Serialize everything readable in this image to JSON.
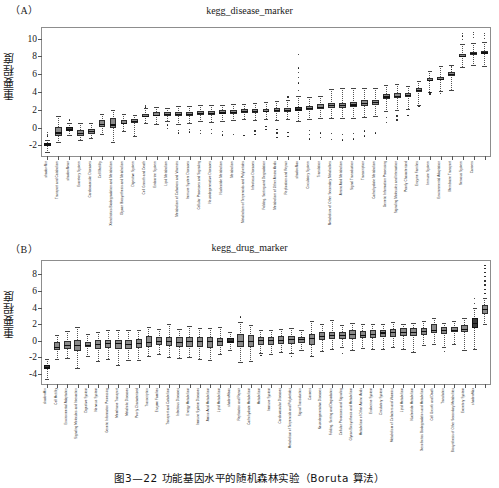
{
  "figure": {
    "caption": "图3—22  功能基因水平的随机森林实验（Boruta 算法）"
  },
  "panels": [
    {
      "tag": "（A）",
      "title": "kegg_disease_marker",
      "ylabel": "重要程度"
    },
    {
      "tag": "（B）",
      "title": "kegg_drug_marker",
      "ylabel": "重要程度"
    }
  ],
  "chart_data": [
    {
      "type": "box",
      "title": "kegg_disease_marker",
      "xlabel": "",
      "ylabel": "重要程度",
      "ylim": [
        -3.2,
        11.2
      ],
      "yticks": [
        -2,
        0,
        2,
        4,
        6,
        8,
        10
      ],
      "grid": false,
      "legend": "none",
      "categories": [
        "shadowMin",
        "Transport and Catabolism",
        "shadowMean",
        "Excretory System",
        "Cardiovascular Diseases",
        "Cell Motility",
        "Xenobiotics Biodegradation and Metabolism",
        "Glycan Biosynthesis and Metabolism",
        "Digestive System",
        "Cell Growth and Death",
        "Endocrine System",
        "Lipid Metabolism",
        "Metabolism of Cofactors and Vitamins",
        "Immune System Diseases",
        "Cellular Processes and Signaling",
        "Neurodegenerative Diseases",
        "Nucleotide Metabolism",
        "Metabolism",
        "Metabolism of Terpenoids and Polyketides",
        "Infectious Diseases",
        "Folding, Sorting and Degradation",
        "Metabolism of Other Amino Acids",
        "Replication and Repair",
        "shadowMax",
        "Circulatory System",
        "Translation",
        "Metabolism of Other Secondary Metabolites",
        "Amino Acid Metabolism",
        "Signal Transduction",
        "Transcription",
        "Carbohydrate Metabolism",
        "Genetic Information Processing",
        "Signaling Molecules and Interaction",
        "Poorly Characterized",
        "Enzyme Families",
        "Immune System",
        "Environmental Adaptation",
        "Membrane Transport",
        "Nervous System",
        "Cancers"
      ],
      "boxes": [
        {
          "q1": -2.05,
          "median": -1.8,
          "q3": -1.7,
          "low": -2.75,
          "high": -1.35,
          "outliers": [
            -0.95,
            -0.75,
            -0.55
          ]
        },
        {
          "q1": -0.95,
          "median": -0.55,
          "q3": 0.05,
          "low": -1.6,
          "high": 1.3,
          "outliers": []
        },
        {
          "q1": -0.35,
          "median": -0.15,
          "q3": 0.1,
          "low": -0.8,
          "high": 0.55,
          "outliers": [
            0.8,
            0.85
          ]
        },
        {
          "q1": -0.95,
          "median": -0.6,
          "q3": -0.3,
          "low": -1.35,
          "high": 0.55,
          "outliers": []
        },
        {
          "q1": -0.7,
          "median": -0.4,
          "q3": -0.2,
          "low": -1.15,
          "high": 0.5,
          "outliers": []
        },
        {
          "q1": 0.05,
          "median": 0.4,
          "q3": 0.85,
          "low": -0.75,
          "high": 1.55,
          "outliers": []
        },
        {
          "q1": -0.05,
          "median": 0.35,
          "q3": 1.05,
          "low": -1.6,
          "high": 1.95,
          "outliers": []
        },
        {
          "q1": 0.35,
          "median": 0.55,
          "q3": 0.8,
          "low": -0.4,
          "high": 1.55,
          "outliers": []
        },
        {
          "q1": 0.5,
          "median": 0.7,
          "q3": 0.95,
          "low": -0.9,
          "high": 1.45,
          "outliers": []
        },
        {
          "q1": 1.15,
          "median": 1.35,
          "q3": 1.55,
          "low": 0.55,
          "high": 2.25,
          "outliers": [
            2.3,
            2.45
          ]
        },
        {
          "q1": 1.25,
          "median": 1.45,
          "q3": 1.7,
          "low": 0.4,
          "high": 2.35,
          "outliers": []
        },
        {
          "q1": 1.35,
          "median": 1.55,
          "q3": 1.75,
          "low": 0.75,
          "high": 2.25,
          "outliers": [
            -0.1,
            0.3
          ]
        },
        {
          "q1": 1.3,
          "median": 1.5,
          "q3": 1.75,
          "low": 0.45,
          "high": 2.45,
          "outliers": [
            -0.6,
            -0.3
          ]
        },
        {
          "q1": 1.35,
          "median": 1.55,
          "q3": 1.8,
          "low": 0.55,
          "high": 2.45,
          "outliers": [
            -0.5,
            -0.2
          ]
        },
        {
          "q1": 1.45,
          "median": 1.65,
          "q3": 1.9,
          "low": 0.7,
          "high": 2.55,
          "outliers": [
            -0.7,
            -0.35
          ]
        },
        {
          "q1": 1.45,
          "median": 1.65,
          "q3": 1.85,
          "low": 0.6,
          "high": 2.5,
          "outliers": [
            -0.65,
            -0.25
          ]
        },
        {
          "q1": 1.5,
          "median": 1.7,
          "q3": 1.95,
          "low": 0.75,
          "high": 2.55,
          "outliers": [
            -0.85,
            -0.45
          ]
        },
        {
          "q1": 1.55,
          "median": 1.75,
          "q3": 1.95,
          "low": 0.85,
          "high": 2.6,
          "outliers": [
            -0.75
          ]
        },
        {
          "q1": 1.65,
          "median": 1.85,
          "q3": 2.05,
          "low": 0.95,
          "high": 2.7,
          "outliers": [
            -0.9
          ]
        },
        {
          "q1": 1.65,
          "median": 1.85,
          "q3": 2.05,
          "low": 0.85,
          "high": 2.75,
          "outliers": [
            -0.8,
            -0.4
          ]
        },
        {
          "q1": 1.7,
          "median": 1.9,
          "q3": 2.1,
          "low": 0.95,
          "high": 2.85,
          "outliers": [
            -0.2,
            0.1
          ]
        },
        {
          "q1": 1.75,
          "median": 1.95,
          "q3": 2.15,
          "low": 0.9,
          "high": 2.95,
          "outliers": [
            -1.1,
            -0.6,
            -0.2
          ]
        },
        {
          "q1": 1.8,
          "median": 2.0,
          "q3": 2.2,
          "low": 0.95,
          "high": 3.05,
          "outliers": [
            -1.0,
            -0.55,
            3.45
          ]
        },
        {
          "q1": 1.85,
          "median": 2.05,
          "q3": 2.3,
          "low": 0.75,
          "high": 3.55,
          "outliers": [
            4.2,
            5.0,
            5.6,
            6.2,
            6.7,
            8.25
          ]
        },
        {
          "q1": 1.95,
          "median": 2.2,
          "q3": 2.45,
          "low": 1.0,
          "high": 3.45,
          "outliers": [
            -1.3,
            -0.8,
            -0.3
          ]
        },
        {
          "q1": 2.1,
          "median": 2.35,
          "q3": 2.6,
          "low": 1.1,
          "high": 3.6,
          "outliers": [
            -1.1,
            -0.6
          ]
        },
        {
          "q1": 2.25,
          "median": 2.5,
          "q3": 2.75,
          "low": 1.05,
          "high": 4.35,
          "outliers": [
            -1.35,
            -0.7
          ]
        },
        {
          "q1": 2.25,
          "median": 2.5,
          "q3": 2.8,
          "low": 1.05,
          "high": 4.4,
          "outliers": [
            -1.4,
            -0.75
          ]
        },
        {
          "q1": 2.3,
          "median": 2.6,
          "q3": 2.9,
          "low": 1.1,
          "high": 4.5,
          "outliers": [
            -1.3,
            -0.65
          ]
        },
        {
          "q1": 2.45,
          "median": 2.75,
          "q3": 3.05,
          "low": 1.2,
          "high": 4.45,
          "outliers": [
            -0.95,
            -0.4
          ]
        },
        {
          "q1": 2.55,
          "median": 2.85,
          "q3": 3.15,
          "low": 1.25,
          "high": 4.5,
          "outliers": [
            -0.6
          ]
        },
        {
          "q1": 3.25,
          "median": 3.5,
          "q3": 3.75,
          "low": 1.85,
          "high": 4.8,
          "outliers": [
            0.55,
            1.1
          ]
        },
        {
          "q1": 3.35,
          "median": 3.6,
          "q3": 3.85,
          "low": 1.95,
          "high": 4.85,
          "outliers": [
            0.85,
            1.3
          ]
        },
        {
          "q1": 3.45,
          "median": 3.65,
          "q3": 3.9,
          "low": 2.05,
          "high": 4.7,
          "outliers": [
            1.35
          ]
        },
        {
          "q1": 3.95,
          "median": 4.2,
          "q3": 4.45,
          "low": 2.55,
          "high": 5.25,
          "outliers": [
            2.4
          ]
        },
        {
          "q1": 5.2,
          "median": 5.4,
          "q3": 5.6,
          "low": 4.0,
          "high": 6.35,
          "outliers": [
            3.7,
            3.9
          ]
        },
        {
          "q1": 5.3,
          "median": 5.5,
          "q3": 5.7,
          "low": 4.1,
          "high": 6.95,
          "outliers": [
            3.85
          ]
        },
        {
          "q1": 5.8,
          "median": 6.0,
          "q3": 6.2,
          "low": 4.2,
          "high": 7.0,
          "outliers": [
            6.55,
            6.9
          ]
        },
        {
          "q1": 7.95,
          "median": 8.1,
          "q3": 8.3,
          "low": 6.85,
          "high": 9.35,
          "outliers": [
            9.9,
            10.3,
            10.55
          ]
        },
        {
          "q1": 8.2,
          "median": 8.35,
          "q3": 8.55,
          "low": 7.05,
          "high": 9.55,
          "outliers": [
            10.1,
            10.45,
            10.7
          ]
        },
        {
          "q1": 8.3,
          "median": 8.45,
          "q3": 8.65,
          "low": 6.95,
          "high": 9.6,
          "outliers": [
            10.05,
            10.35,
            10.6
          ]
        }
      ]
    },
    {
      "type": "box",
      "title": "kegg_drug_marker",
      "xlabel": "",
      "ylabel": "重要程度",
      "ylim": [
        -5.2,
        9.6
      ],
      "yticks": [
        -4,
        -2,
        0,
        2,
        4,
        6,
        8
      ],
      "grid": false,
      "legend": "none",
      "categories": [
        "shadowMin",
        "Cell Motility",
        "Environmental Adaptation",
        "Signaling Molecules and Interaction",
        "Digestive System",
        "Nervous System",
        "Genetic Information Processing",
        "Membrane Transport",
        "Metabolic Diseases",
        "Poorly Characterized",
        "Transcription",
        "Enzyme Families",
        "Transport and Catabolism",
        "Infectious Diseases",
        "Energy Metabolism",
        "Immune System Diseases",
        "Amino Acid Metabolism",
        "Lipid Metabolism",
        "shadowMean",
        "Replication and Repair",
        "Carbohydrate Metabolism",
        "Metabolism",
        "Immune System",
        "Cardiovascular Diseases",
        "Metabolism of Terpenoids and Polyketides",
        "Signal Transduction",
        "Cancers",
        "Neurodegenerative Diseases",
        "Folding, Sorting and Degradation",
        "Cellular Processes and Signaling",
        "Glycan Biosynthesis and Metabolism",
        "Metabolism of Other Amino Acids",
        "Endocrine System",
        "Circulatory System",
        "Metabolism of Cofactors and Vitamins",
        "Lipid Metabolism",
        "Nucleotide Metabolism",
        "Xenobiotics Biodegradation and Metabolism",
        "Cell Growth and Death",
        "Translation",
        "Biosynthesis of Other Secondary Metabolites",
        "Excretory System",
        "shadowMax"
      ],
      "boxes": [
        {
          "q1": -3.4,
          "median": -3.15,
          "q3": -2.95,
          "low": -4.55,
          "high": -2.15,
          "outliers": []
        },
        {
          "q1": -1.15,
          "median": -0.7,
          "q3": -0.15,
          "low": -2.25,
          "high": 0.65,
          "outliers": []
        },
        {
          "q1": -0.95,
          "median": -0.45,
          "q3": 0.0,
          "low": -2.1,
          "high": 1.2,
          "outliers": []
        },
        {
          "q1": -1.2,
          "median": -0.55,
          "q3": 0.05,
          "low": -3.25,
          "high": 1.6,
          "outliers": []
        },
        {
          "q1": -0.8,
          "median": -0.45,
          "q3": -0.1,
          "low": -1.85,
          "high": 0.8,
          "outliers": []
        },
        {
          "q1": -0.95,
          "median": -0.4,
          "q3": 0.05,
          "low": -2.4,
          "high": 1.1,
          "outliers": []
        },
        {
          "q1": -0.85,
          "median": -0.3,
          "q3": 0.15,
          "low": -2.2,
          "high": 1.25,
          "outliers": []
        },
        {
          "q1": -0.95,
          "median": -0.3,
          "q3": 0.15,
          "low": -2.95,
          "high": 1.35,
          "outliers": []
        },
        {
          "q1": -0.95,
          "median": -0.35,
          "q3": 0.15,
          "low": -2.3,
          "high": 1.3,
          "outliers": []
        },
        {
          "q1": -0.9,
          "median": -0.25,
          "q3": 0.2,
          "low": -2.35,
          "high": 1.25,
          "outliers": []
        },
        {
          "q1": -0.7,
          "median": -0.15,
          "q3": 0.55,
          "low": -1.85,
          "high": 1.65,
          "outliers": []
        },
        {
          "q1": -0.55,
          "median": -0.05,
          "q3": 0.4,
          "low": -1.55,
          "high": 1.4,
          "outliers": []
        },
        {
          "q1": -0.65,
          "median": 0.0,
          "q3": 0.5,
          "low": -1.9,
          "high": 2.0,
          "outliers": []
        },
        {
          "q1": -0.75,
          "median": -0.1,
          "q3": 0.4,
          "low": -2.1,
          "high": 1.45,
          "outliers": []
        },
        {
          "q1": -0.7,
          "median": 0.0,
          "q3": 0.5,
          "low": -1.95,
          "high": 1.8,
          "outliers": []
        },
        {
          "q1": -0.8,
          "median": 0.0,
          "q3": 0.45,
          "low": -2.15,
          "high": 1.55,
          "outliers": []
        },
        {
          "q1": -0.85,
          "median": 0.0,
          "q3": 0.5,
          "low": -2.35,
          "high": 1.5,
          "outliers": []
        },
        {
          "q1": -0.6,
          "median": 0.0,
          "q3": 0.35,
          "low": -1.55,
          "high": 1.6,
          "outliers": []
        },
        {
          "q1": -0.25,
          "median": 0.0,
          "q3": 0.3,
          "low": -1.1,
          "high": 1.0,
          "outliers": []
        },
        {
          "q1": -0.8,
          "median": 0.0,
          "q3": 0.8,
          "low": -2.6,
          "high": 2.3,
          "outliers": [
            2.85
          ]
        },
        {
          "q1": -0.75,
          "median": 0.0,
          "q3": 0.75,
          "low": -2.45,
          "high": 1.85,
          "outliers": []
        },
        {
          "q1": -0.45,
          "median": 0.1,
          "q3": 0.5,
          "low": -1.45,
          "high": 1.3,
          "outliers": [
            -1.75
          ]
        },
        {
          "q1": -0.45,
          "median": 0.1,
          "q3": 0.5,
          "low": -1.6,
          "high": 1.35,
          "outliers": []
        },
        {
          "q1": -0.4,
          "median": 0.15,
          "q3": 0.55,
          "low": -1.4,
          "high": 1.4,
          "outliers": []
        },
        {
          "q1": -0.35,
          "median": 0.2,
          "q3": 0.6,
          "low": -1.45,
          "high": 1.55,
          "outliers": [
            -1.85
          ]
        },
        {
          "q1": -0.25,
          "median": 0.2,
          "q3": 0.5,
          "low": -1.15,
          "high": 1.25,
          "outliers": []
        },
        {
          "q1": -0.45,
          "median": 0.35,
          "q3": 0.85,
          "low": -1.85,
          "high": 2.35,
          "outliers": []
        },
        {
          "q1": 0.05,
          "median": 0.55,
          "q3": 1.0,
          "low": -1.2,
          "high": 2.05,
          "outliers": []
        },
        {
          "q1": 0.2,
          "median": 0.65,
          "q3": 1.1,
          "low": -1.0,
          "high": 2.45,
          "outliers": []
        },
        {
          "q1": 0.25,
          "median": 0.7,
          "q3": 1.0,
          "low": -0.8,
          "high": 1.85,
          "outliers": [
            -1.55
          ]
        },
        {
          "q1": 0.2,
          "median": 0.8,
          "q3": 1.3,
          "low": -1.15,
          "high": 2.15,
          "outliers": []
        },
        {
          "q1": 0.3,
          "median": 0.75,
          "q3": 1.2,
          "low": -0.9,
          "high": 2.0,
          "outliers": []
        },
        {
          "q1": 0.35,
          "median": 0.85,
          "q3": 1.25,
          "low": -0.95,
          "high": 2.05,
          "outliers": []
        },
        {
          "q1": 0.45,
          "median": 1.0,
          "q3": 1.35,
          "low": -0.95,
          "high": 2.0,
          "outliers": []
        },
        {
          "q1": 0.5,
          "median": 1.05,
          "q3": 1.45,
          "low": -0.75,
          "high": 2.25,
          "outliers": []
        },
        {
          "q1": 0.55,
          "median": 1.1,
          "q3": 1.5,
          "low": -0.95,
          "high": 2.0,
          "outliers": []
        },
        {
          "q1": 0.6,
          "median": 1.1,
          "q3": 1.55,
          "low": -1.35,
          "high": 2.2,
          "outliers": []
        },
        {
          "q1": 0.75,
          "median": 1.15,
          "q3": 1.55,
          "low": -0.45,
          "high": 2.4,
          "outliers": []
        },
        {
          "q1": 0.9,
          "median": 1.35,
          "q3": 2.0,
          "low": -0.4,
          "high": 2.75,
          "outliers": []
        },
        {
          "q1": 0.85,
          "median": 1.3,
          "q3": 1.7,
          "low": -0.75,
          "high": 2.2,
          "outliers": [
            -1.3
          ]
        },
        {
          "q1": 1.0,
          "median": 1.35,
          "q3": 1.7,
          "low": -0.35,
          "high": 2.35,
          "outliers": []
        },
        {
          "q1": 1.0,
          "median": 1.45,
          "q3": 1.95,
          "low": -1.05,
          "high": 2.8,
          "outliers": []
        },
        {
          "q1": 1.55,
          "median": 2.2,
          "q3": 2.7,
          "low": -0.95,
          "high": 3.95,
          "outliers": [
            4.5,
            5.1
          ]
        },
        {
          "q1": 3.25,
          "median": 3.8,
          "q3": 4.3,
          "low": 2.0,
          "high": 5.15,
          "outliers": [
            5.7,
            6.2,
            6.7,
            7.2,
            7.7,
            8.2,
            8.7,
            9.1
          ]
        }
      ]
    }
  ]
}
